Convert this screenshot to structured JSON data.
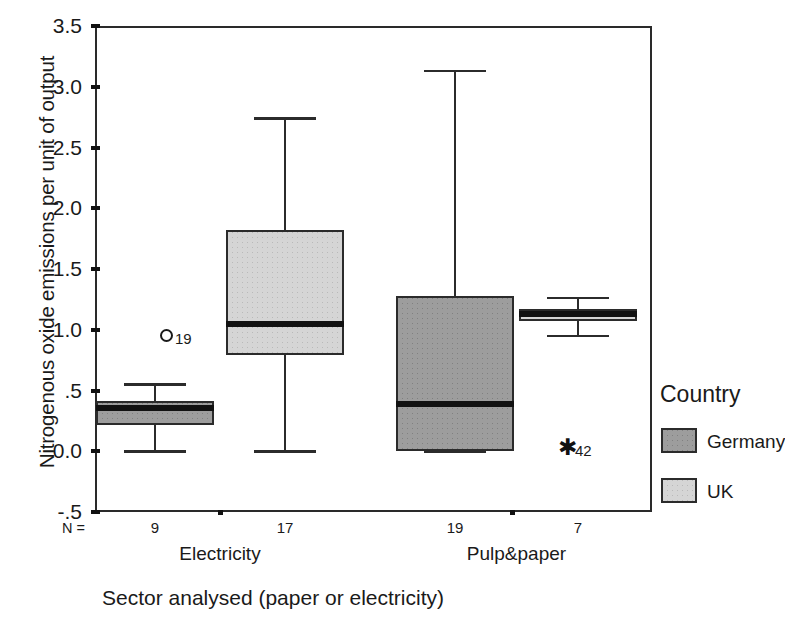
{
  "chart_data": {
    "type": "box",
    "title": "",
    "xlabel": "Sector analysed (paper or electricity)",
    "ylabel": "Nitrogenous oxide emissions per unit of output",
    "ylim": [
      -0.5,
      3.5
    ],
    "y_ticks": [
      "3.5",
      "3.0",
      "2.5",
      "2.0",
      "1.5",
      "1.0",
      ".5",
      "0.0",
      "-.5"
    ],
    "y_tick_values": [
      3.5,
      3.0,
      2.5,
      2.0,
      1.5,
      1.0,
      0.5,
      0.0,
      -0.5
    ],
    "grid": false,
    "categories": [
      "Electricity",
      "Pulp&paper"
    ],
    "n_prefix": "N =",
    "legend": {
      "title": "Country",
      "position": "right",
      "entries": [
        {
          "label": "Germany",
          "color": "#9d9d9d"
        },
        {
          "label": "UK",
          "color": "#d5d5d5"
        }
      ]
    },
    "boxes": [
      {
        "category": "Electricity",
        "series": "Germany",
        "n": "9",
        "whisker_low": 0.0,
        "q1": 0.22,
        "median": 0.36,
        "q3": 0.41,
        "whisker_high": 0.55,
        "outliers": [
          {
            "label": "19",
            "value": 0.95,
            "type": "mild"
          }
        ]
      },
      {
        "category": "Electricity",
        "series": "UK",
        "n": "17",
        "whisker_low": 0.0,
        "q1": 0.79,
        "median": 1.05,
        "q3": 1.82,
        "whisker_high": 2.74,
        "outliers": []
      },
      {
        "category": "Pulp&paper",
        "series": "Germany",
        "n": "19",
        "whisker_low": 0.0,
        "q1": 0.0,
        "median": 0.39,
        "q3": 1.28,
        "whisker_high": 3.13,
        "outliers": []
      },
      {
        "category": "Pulp&paper",
        "series": "UK",
        "n": "7",
        "whisker_low": 0.95,
        "q1": 1.07,
        "median": 1.13,
        "q3": 1.17,
        "whisker_high": 1.26,
        "outliers": [
          {
            "label": "42",
            "value": 0.0,
            "type": "extreme"
          }
        ]
      }
    ],
    "marker_glyphs": {
      "extreme": "✱",
      "mild": "○"
    }
  }
}
